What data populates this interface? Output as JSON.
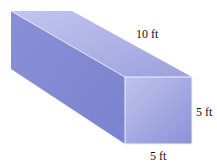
{
  "figure": {
    "shape": "rectangular prism",
    "labels": {
      "length": "10 ft",
      "height": "5 ft",
      "width": "5 ft"
    },
    "colors": {
      "top_face": "#b4b8e6",
      "left_face": "#8088d2",
      "front_face": "#9ea2de",
      "edge": "#eef0fb"
    }
  }
}
